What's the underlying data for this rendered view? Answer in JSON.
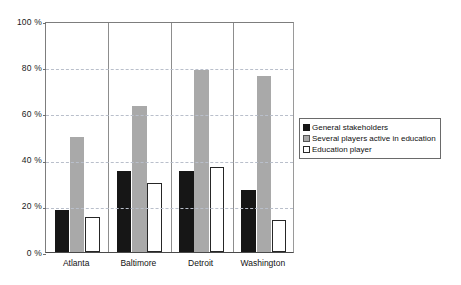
{
  "chart_data": {
    "type": "bar",
    "title": "",
    "subtitle": "",
    "xlabel": "",
    "ylabel": "",
    "categories": [
      "Atlanta",
      "Baltimore",
      "Detroit",
      "Washington"
    ],
    "series": [
      {
        "name": "General stakeholders",
        "color": "#161616",
        "values": [
          18,
          35,
          35,
          27
        ]
      },
      {
        "name": "Several players active in education",
        "color": "#a9a9a9",
        "values": [
          50,
          63,
          79,
          76
        ]
      },
      {
        "name": "Education player",
        "color": "#ffffff",
        "values": [
          15,
          30,
          37,
          14
        ]
      }
    ],
    "ylim": [
      0,
      100
    ],
    "yticks": [
      0,
      20,
      40,
      60,
      80,
      100
    ],
    "ytick_labels": [
      "0 %",
      "20 %",
      "40 %",
      "60 %",
      "80 %",
      "100 %"
    ],
    "grid": true,
    "grid_axis": "y",
    "grid_style": "dashed",
    "legend_position": "right",
    "legend_entries": [
      "General stakeholders",
      "Several players active in education",
      "Education player"
    ],
    "value_unit": "%",
    "annotations": []
  },
  "colors": {
    "series_1": "#161616",
    "series_2": "#a9a9a9",
    "series_3": "#ffffff",
    "gridline": "#b9bfcb",
    "axis": "#6f6f6f",
    "background": "#ffffff",
    "text": "#111111"
  }
}
